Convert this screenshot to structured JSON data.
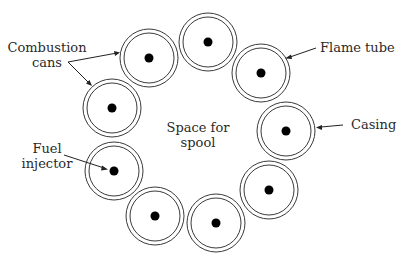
{
  "diagram": {
    "labels": {
      "combustion_cans_line1": "Combustion",
      "combustion_cans_line2": "cans",
      "flame_tube": "Flame tube",
      "casing": "Casing",
      "fuel_injector_line1": "Fuel",
      "fuel_injector_line2": "injector",
      "center_line1": "Space for",
      "center_line2": "spool"
    },
    "cans": [
      {
        "id": 1,
        "cx": 149,
        "cy": 58
      },
      {
        "id": 2,
        "cx": 208,
        "cy": 42
      },
      {
        "id": 3,
        "cx": 261,
        "cy": 73
      },
      {
        "id": 4,
        "cx": 286,
        "cy": 131
      },
      {
        "id": 5,
        "cx": 269,
        "cy": 190
      },
      {
        "id": 6,
        "cx": 216,
        "cy": 223
      },
      {
        "id": 7,
        "cx": 155,
        "cy": 216
      },
      {
        "id": 8,
        "cx": 114,
        "cy": 171
      },
      {
        "id": 9,
        "cx": 112,
        "cy": 108
      }
    ],
    "can_geometry": {
      "outer_radius": 29,
      "inner_radius": 25,
      "injector_radius": 4.5
    },
    "colors": {
      "stroke": "#3a3a3a",
      "injector": "#000000",
      "text": "#2a2a2a",
      "background": "#ffffff"
    }
  }
}
